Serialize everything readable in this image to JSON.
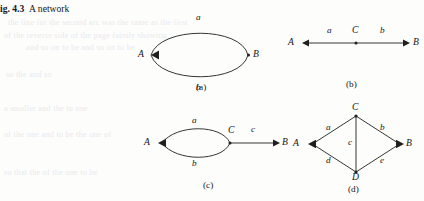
{
  "caption": {
    "number": "ig. 4.3",
    "text": "A network"
  },
  "background_bleed": [
    "the line for the second arc was the same as the first",
    "of the reverse side of the page faintly showing",
    "and so on to be and so on to be",
    "so the and so",
    "a smaller and the to one",
    "of the one and to be the one of",
    "so that the of the one to be"
  ],
  "panels": [
    {
      "id": "a",
      "label": "(a)",
      "type": "two-parallel-arcs",
      "nodes": [
        {
          "name": "A",
          "label": "A",
          "marker": "arrowhead"
        },
        {
          "name": "B",
          "label": "B",
          "marker": "dot"
        }
      ],
      "edges": [
        {
          "name": "a",
          "label": "a",
          "position": "above",
          "from": "B",
          "to": "A"
        },
        {
          "name": "b",
          "label": "b",
          "position": "below",
          "from": "B",
          "to": "A"
        }
      ]
    },
    {
      "id": "b",
      "label": "(b)",
      "type": "series-line",
      "nodes": [
        {
          "name": "A",
          "label": "A",
          "marker": "arrowhead"
        },
        {
          "name": "C",
          "label": "C",
          "marker": "dot"
        },
        {
          "name": "B",
          "label": "B",
          "marker": "arrowhead"
        }
      ],
      "edges": [
        {
          "name": "a",
          "label": "a",
          "position": "above",
          "from": "A",
          "to": "C"
        },
        {
          "name": "b",
          "label": "b",
          "position": "above",
          "from": "C",
          "to": "B"
        }
      ]
    },
    {
      "id": "c",
      "label": "(c)",
      "type": "two-arcs-plus-series",
      "nodes": [
        {
          "name": "A",
          "label": "A",
          "marker": "arrowhead"
        },
        {
          "name": "C",
          "label": "C",
          "marker": "dot"
        },
        {
          "name": "B",
          "label": "B",
          "marker": "arrowhead"
        }
      ],
      "edges": [
        {
          "name": "a",
          "label": "a",
          "position": "above",
          "from": "C",
          "to": "A"
        },
        {
          "name": "b",
          "label": "b",
          "position": "below",
          "from": "C",
          "to": "A"
        },
        {
          "name": "c",
          "label": "c",
          "position": "above",
          "from": "C",
          "to": "B"
        }
      ]
    },
    {
      "id": "d",
      "label": "(d)",
      "type": "bridge-rhombus",
      "nodes": [
        {
          "name": "C",
          "label": "C",
          "marker": "dot"
        },
        {
          "name": "A",
          "label": "A",
          "marker": "arrowhead"
        },
        {
          "name": "B",
          "label": "B",
          "marker": "arrowhead"
        },
        {
          "name": "D",
          "label": "D",
          "marker": "dot"
        }
      ],
      "edges": [
        {
          "name": "a",
          "label": "a",
          "position": "upper-left",
          "from": "C",
          "to": "A"
        },
        {
          "name": "b",
          "label": "b",
          "position": "upper-right",
          "from": "C",
          "to": "B"
        },
        {
          "name": "c",
          "label": "c",
          "position": "middle-vertical",
          "from": "C",
          "to": "D"
        },
        {
          "name": "d",
          "label": "d",
          "position": "lower-left",
          "from": "D",
          "to": "A"
        },
        {
          "name": "e",
          "label": "e",
          "position": "lower-right",
          "from": "D",
          "to": "B"
        }
      ]
    }
  ],
  "colors": {
    "ink": "#1b1b1b",
    "paper": "#fdfdfc",
    "bleed": "#e9e9ec"
  }
}
